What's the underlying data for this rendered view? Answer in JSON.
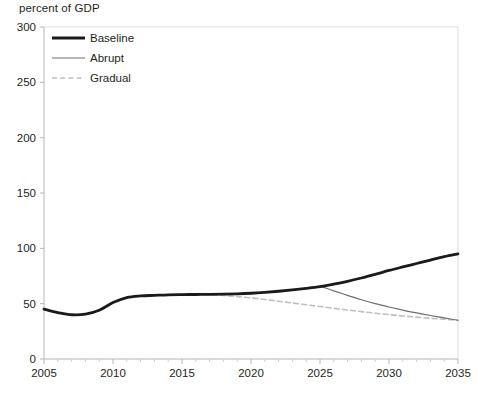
{
  "chart_data": {
    "type": "line",
    "title": "",
    "ylabel": "percent of GDP",
    "xlabel": "",
    "xlim": [
      2005,
      2035
    ],
    "ylim": [
      0,
      300
    ],
    "ytick_values": [
      0,
      50,
      100,
      150,
      200,
      250,
      300
    ],
    "ytick_labels": [
      "0",
      "50",
      "100",
      "150",
      "200",
      "250",
      "300"
    ],
    "xtick_values": [
      2005,
      2010,
      2015,
      2020,
      2025,
      2030,
      2035
    ],
    "xtick_labels": [
      "2005",
      "2010",
      "2015",
      "2020",
      "2025",
      "2030",
      "2035"
    ],
    "x_minor_tick_step": 1,
    "grid": false,
    "legend_position": "top-left",
    "series": [
      {
        "name": "Baseline",
        "style": "solid-thick-black",
        "color": "#1a1a1a",
        "width": 2.8,
        "x": [
          2005,
          2006,
          2007,
          2008,
          2009,
          2010,
          2011,
          2012,
          2013,
          2014,
          2015,
          2016,
          2017,
          2018,
          2019,
          2020,
          2021,
          2022,
          2023,
          2024,
          2025,
          2026,
          2027,
          2028,
          2029,
          2030,
          2031,
          2032,
          2033,
          2034,
          2035
        ],
        "values": [
          45,
          42,
          40,
          40.5,
          44,
          51,
          55.5,
          57,
          57.5,
          58,
          58.2,
          58.3,
          58.4,
          58.6,
          58.9,
          59.4,
          60.2,
          61.2,
          62.4,
          63.8,
          65.4,
          67.6,
          70.2,
          73.2,
          76.5,
          80.0,
          83.2,
          86.3,
          89.4,
          92.4,
          95.0
        ]
      },
      {
        "name": "Abrupt",
        "style": "solid-thin-gray",
        "color": "#6e6e6e",
        "width": 1.2,
        "x": [
          2005,
          2006,
          2007,
          2008,
          2009,
          2010,
          2011,
          2012,
          2013,
          2014,
          2015,
          2016,
          2017,
          2018,
          2019,
          2020,
          2021,
          2022,
          2023,
          2024,
          2025,
          2026,
          2027,
          2028,
          2029,
          2030,
          2031,
          2032,
          2033,
          2034,
          2035
        ],
        "values": [
          45,
          42,
          40,
          40.5,
          44,
          51,
          55.5,
          57,
          57.5,
          58,
          58.2,
          58.3,
          58.4,
          58.6,
          58.9,
          59.4,
          60.2,
          61.2,
          62.4,
          63.8,
          65.4,
          61.5,
          57.5,
          53.5,
          50.0,
          47.0,
          44.2,
          41.6,
          39.3,
          37.2,
          35.0
        ]
      },
      {
        "name": "Gradual",
        "style": "dashed-light-gray",
        "color": "#bfbfbf",
        "width": 1.6,
        "x": [
          2005,
          2006,
          2007,
          2008,
          2009,
          2010,
          2011,
          2012,
          2013,
          2014,
          2015,
          2016,
          2017,
          2018,
          2019,
          2020,
          2021,
          2022,
          2023,
          2024,
          2025,
          2026,
          2027,
          2028,
          2029,
          2030,
          2031,
          2032,
          2033,
          2034,
          2035
        ],
        "values": [
          45,
          42,
          40,
          40.5,
          44,
          51,
          55.5,
          57,
          57.5,
          58,
          58.2,
          58.2,
          58.0,
          57.4,
          56.4,
          55.2,
          53.8,
          52.2,
          50.6,
          49.0,
          47.4,
          45.8,
          44.3,
          42.8,
          41.4,
          40.1,
          38.9,
          37.8,
          36.8,
          35.9,
          35.0
        ]
      }
    ],
    "legend": [
      {
        "label": "Baseline"
      },
      {
        "label": "Abrupt"
      },
      {
        "label": "Gradual"
      }
    ],
    "axis_color": "#b5b5b5"
  }
}
